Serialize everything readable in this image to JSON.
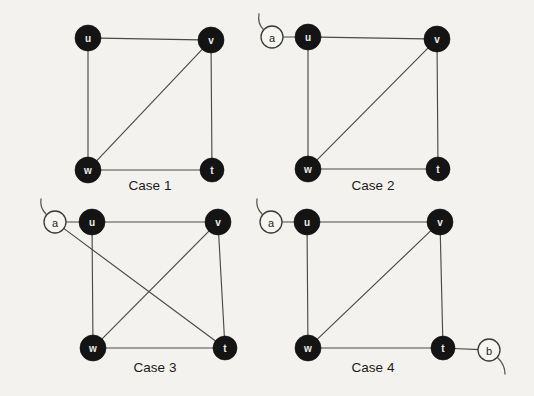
{
  "figure": {
    "background_color": "#f3f2ee",
    "node_fill_color": "#141414",
    "open_node_fill_color": "#f6f5f1",
    "edge_color": "#4a4a48",
    "label_color": "#1b1b19"
  },
  "panels": [
    {
      "id": "case-1",
      "caption": "Case 1",
      "caption_x": 150,
      "caption_y": 190,
      "nodes": [
        {
          "id": "u",
          "label": "u",
          "x": 88,
          "y": 38,
          "r": 13,
          "style": "filled"
        },
        {
          "id": "v",
          "label": "v",
          "x": 211,
          "y": 40,
          "r": 13,
          "style": "filled"
        },
        {
          "id": "w",
          "label": "w",
          "x": 88,
          "y": 170,
          "r": 13,
          "style": "filled"
        },
        {
          "id": "t",
          "label": "t",
          "x": 212,
          "y": 170,
          "r": 12,
          "style": "filled"
        }
      ],
      "edges": [
        {
          "from": "u",
          "to": "v"
        },
        {
          "from": "u",
          "to": "w"
        },
        {
          "from": "v",
          "to": "t"
        },
        {
          "from": "w",
          "to": "t"
        },
        {
          "from": "w",
          "to": "v"
        }
      ],
      "stubs": []
    },
    {
      "id": "case-2",
      "caption": "Case 2",
      "caption_x": 373,
      "caption_y": 190,
      "nodes": [
        {
          "id": "a",
          "label": "a",
          "x": 272,
          "y": 37,
          "r": 11,
          "style": "open"
        },
        {
          "id": "u",
          "label": "u",
          "x": 308,
          "y": 37,
          "r": 13,
          "style": "filled"
        },
        {
          "id": "v",
          "label": "v",
          "x": 437,
          "y": 39,
          "r": 13,
          "style": "filled"
        },
        {
          "id": "w",
          "label": "w",
          "x": 308,
          "y": 169,
          "r": 13,
          "style": "filled"
        },
        {
          "id": "t",
          "label": "t",
          "x": 438,
          "y": 169,
          "r": 12,
          "style": "filled"
        }
      ],
      "edges": [
        {
          "from": "a",
          "to": "u"
        },
        {
          "from": "u",
          "to": "v"
        },
        {
          "from": "u",
          "to": "w"
        },
        {
          "from": "v",
          "to": "t"
        },
        {
          "from": "w",
          "to": "t"
        },
        {
          "from": "w",
          "to": "v"
        }
      ],
      "stubs": [
        {
          "node": "a",
          "path": "M 263 29 C 259 25 258 20 259 14"
        }
      ]
    },
    {
      "id": "case-3",
      "caption": "Case 3",
      "caption_x": 155,
      "caption_y": 372,
      "nodes": [
        {
          "id": "a",
          "label": "a",
          "x": 55,
          "y": 222,
          "r": 11,
          "style": "open"
        },
        {
          "id": "u",
          "label": "u",
          "x": 92,
          "y": 222,
          "r": 13,
          "style": "filled"
        },
        {
          "id": "v",
          "label": "v",
          "x": 218,
          "y": 222,
          "r": 13,
          "style": "filled"
        },
        {
          "id": "w",
          "label": "w",
          "x": 93,
          "y": 348,
          "r": 13,
          "style": "filled"
        },
        {
          "id": "t",
          "label": "t",
          "x": 225,
          "y": 348,
          "r": 12,
          "style": "filled"
        }
      ],
      "edges": [
        {
          "from": "a",
          "to": "u"
        },
        {
          "from": "a",
          "to": "t"
        },
        {
          "from": "u",
          "to": "v"
        },
        {
          "from": "u",
          "to": "w"
        },
        {
          "from": "v",
          "to": "t"
        },
        {
          "from": "w",
          "to": "t"
        },
        {
          "from": "w",
          "to": "v"
        }
      ],
      "stubs": [
        {
          "node": "a",
          "path": "M 46 214 C 42 210 40 205 41 199"
        }
      ]
    },
    {
      "id": "case-4",
      "caption": "Case 4",
      "caption_x": 373,
      "caption_y": 372,
      "nodes": [
        {
          "id": "a",
          "label": "a",
          "x": 271,
          "y": 222,
          "r": 11,
          "style": "open"
        },
        {
          "id": "u",
          "label": "u",
          "x": 307,
          "y": 222,
          "r": 13,
          "style": "filled"
        },
        {
          "id": "v",
          "label": "v",
          "x": 440,
          "y": 222,
          "r": 13,
          "style": "filled"
        },
        {
          "id": "w",
          "label": "w",
          "x": 308,
          "y": 348,
          "r": 13,
          "style": "filled"
        },
        {
          "id": "t",
          "label": "t",
          "x": 443,
          "y": 348,
          "r": 12,
          "style": "filled"
        },
        {
          "id": "b",
          "label": "b",
          "x": 489,
          "y": 350,
          "r": 11,
          "style": "open"
        }
      ],
      "edges": [
        {
          "from": "a",
          "to": "u"
        },
        {
          "from": "u",
          "to": "v"
        },
        {
          "from": "u",
          "to": "w"
        },
        {
          "from": "v",
          "to": "t"
        },
        {
          "from": "w",
          "to": "t"
        },
        {
          "from": "w",
          "to": "v"
        },
        {
          "from": "t",
          "to": "b"
        }
      ],
      "stubs": [
        {
          "node": "a",
          "path": "M 262 214 C 258 210 256 205 257 199"
        },
        {
          "node": "b",
          "path": "M 498 358 C 502 362 505 368 505 374"
        }
      ]
    }
  ],
  "background_bleed": [
    {
      "text": "",
      "x": 0,
      "y": 0
    }
  ]
}
